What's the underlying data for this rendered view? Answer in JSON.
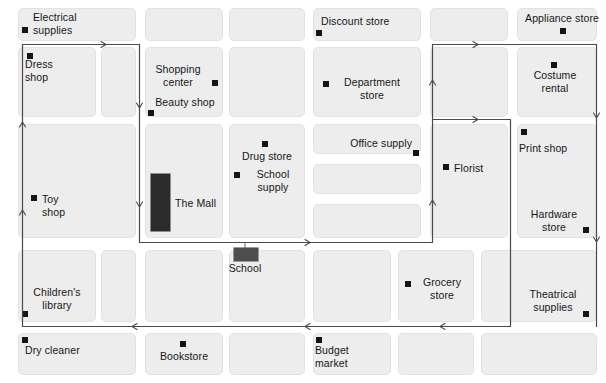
{
  "map": {
    "title": "City block map with walking route",
    "colors": {
      "background": "#ffffff",
      "block_fill": "#ededed",
      "block_border": "#e2e2e2",
      "route_line": "#4a4a4a",
      "marker": "#151515",
      "mall_building": "#2b2b2b",
      "school_building": "#4d4d4d"
    },
    "labels": {
      "electrical_supplies": "Electrical\nsupplies",
      "discount_store": "Discount store",
      "appliance_store": "Appliance store",
      "dress_shop": "Dress\nshop",
      "shopping_center": "Shopping\ncenter",
      "beauty_shop": "Beauty shop",
      "department_store": "Department\nstore",
      "costume_rental": "Costume\nrental",
      "drug_store": "Drug store",
      "school_supply": "School\nsupply",
      "office_supply": "Office supply",
      "florist": "Florist",
      "print_shop": "Print shop",
      "toy_shop": "Toy\nshop",
      "the_mall": "The Mall",
      "hardware_store": "Hardware\nstore",
      "children_library": "Children's\nlibrary",
      "school": "School",
      "grocery_store": "Grocery\nstore",
      "theatrical_supplies": "Theatrical\nsupplies",
      "dry_cleaner": "Dry cleaner",
      "bookstore": "Bookstore",
      "budget_market": "Budget\nmarket"
    },
    "pois": [
      {
        "key": "electrical_supplies",
        "label": "Electrical\nsupplies",
        "marker": true
      },
      {
        "key": "discount_store",
        "label": "Discount store",
        "marker": true
      },
      {
        "key": "appliance_store",
        "label": "Appliance store",
        "marker": true
      },
      {
        "key": "dress_shop",
        "label": "Dress\nshop",
        "marker": true
      },
      {
        "key": "shopping_center",
        "label": "Shopping\ncenter",
        "marker": true
      },
      {
        "key": "beauty_shop",
        "label": "Beauty shop",
        "marker": true
      },
      {
        "key": "department_store",
        "label": "Department\nstore",
        "marker": true
      },
      {
        "key": "costume_rental",
        "label": "Costume\nrental",
        "marker": true
      },
      {
        "key": "drug_store",
        "label": "Drug store",
        "marker": true
      },
      {
        "key": "school_supply",
        "label": "School\nsupply",
        "marker": true
      },
      {
        "key": "office_supply",
        "label": "Office supply",
        "marker": true
      },
      {
        "key": "florist",
        "label": "Florist",
        "marker": true
      },
      {
        "key": "print_shop",
        "label": "Print shop",
        "marker": true
      },
      {
        "key": "toy_shop",
        "label": "Toy\nshop",
        "marker": true
      },
      {
        "key": "the_mall",
        "label": "The Mall",
        "marker": false
      },
      {
        "key": "hardware_store",
        "label": "Hardware\nstore",
        "marker": true
      },
      {
        "key": "children_library",
        "label": "Children's\nlibrary",
        "marker": true
      },
      {
        "key": "school",
        "label": "School",
        "marker": false
      },
      {
        "key": "grocery_store",
        "label": "Grocery\nstore",
        "marker": true
      },
      {
        "key": "theatrical_supplies",
        "label": "Theatrical\nsupplies",
        "marker": true
      },
      {
        "key": "dry_cleaner",
        "label": "Dry cleaner",
        "marker": true
      },
      {
        "key": "bookstore",
        "label": "Bookstore",
        "marker": true
      },
      {
        "key": "budget_market",
        "label": "Budget\nmarket",
        "marker": true
      }
    ],
    "route": {
      "name": "walking-route",
      "direction_arrows": 9,
      "closed_loop": true
    }
  }
}
